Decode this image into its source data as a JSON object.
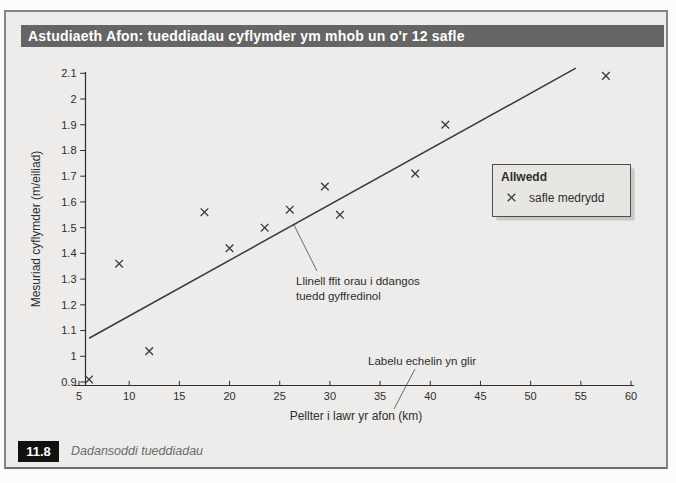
{
  "title": "Astudiaeth Afon: tueddiadau cyflymder ym mhob un o'r 12 safle",
  "figure_label": {
    "number": "11.8",
    "caption": "Dadansoddi tueddiadau"
  },
  "legend": {
    "title": "Allwedd",
    "items": [
      {
        "marker": "x-cross",
        "label": "safle medrydd"
      }
    ]
  },
  "annotations": {
    "best_fit_line1": "Llinell ffit orau i ddangos",
    "best_fit_line2": "tuedd gyffredinol",
    "axis_note": "Labelu echelin yn glir"
  },
  "chart_data": {
    "type": "scatter",
    "title": "",
    "xlabel": "Pellter i lawr yr afon (km)",
    "ylabel": "Mesuriad cyflymder (m/eiliad)",
    "xlim": [
      5,
      60
    ],
    "ylim": [
      0.9,
      2.1
    ],
    "xticks": [
      "5",
      "10",
      "15",
      "20",
      "25",
      "30",
      "35",
      "40",
      "45",
      "50",
      "55",
      "60"
    ],
    "yticks": [
      "0.9",
      "1",
      "1.1",
      "1.2",
      "1.3",
      "1.4",
      "1.5",
      "1.6",
      "1.7",
      "1.8",
      "1.9",
      "2",
      "2.1"
    ],
    "grid": false,
    "legend_position": "middle-right",
    "series": [
      {
        "name": "safle medrydd",
        "marker": "x",
        "points": [
          [
            6,
            0.91
          ],
          [
            9,
            1.36
          ],
          [
            12,
            1.02
          ],
          [
            17.5,
            1.56
          ],
          [
            20,
            1.42
          ],
          [
            23.5,
            1.5
          ],
          [
            26,
            1.57
          ],
          [
            29.5,
            1.66
          ],
          [
            31,
            1.55
          ],
          [
            38.5,
            1.71
          ],
          [
            41.5,
            1.9
          ],
          [
            57.5,
            2.09
          ]
        ]
      }
    ],
    "trend_line": {
      "from": [
        6,
        1.07
      ],
      "to": [
        54.5,
        2.12
      ]
    }
  },
  "colors": {
    "title_bar_bg": "#656565",
    "title_text": "#ffffff",
    "figure_bg": "#edecea",
    "border": "#858585",
    "axis": "#2e2e2e",
    "marker": "#3a3a3a",
    "trend_line": "#3a3a3a",
    "legend_bg": "#e7e6e3",
    "badge_bg": "#111111",
    "caption_text": "#6b6b6b"
  }
}
